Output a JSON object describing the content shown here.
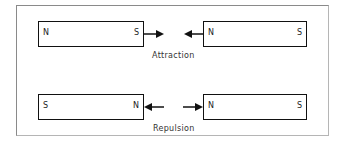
{
  "diagram": {
    "attraction": {
      "caption": "Attraction",
      "left_magnet": {
        "left_pole": "N",
        "right_pole": "S"
      },
      "right_magnet": {
        "left_pole": "N",
        "right_pole": "S"
      },
      "arrows": [
        "right-pointing from S",
        "left-pointing into N"
      ]
    },
    "repulsion": {
      "caption": "Repulsion",
      "left_magnet": {
        "left_pole": "S",
        "right_pole": "N"
      },
      "right_magnet": {
        "left_pole": "N",
        "right_pole": "S"
      },
      "arrows": [
        "left-pointing into N",
        "right-pointing into N"
      ]
    },
    "colors": {
      "line": "#111111",
      "frame": "#8a8a8a",
      "background": "#ffffff"
    }
  }
}
